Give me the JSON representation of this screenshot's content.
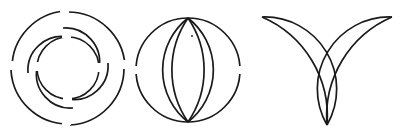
{
  "page": {
    "width": 400,
    "height": 135,
    "background_color": "#ffffff",
    "ink_color": "#1a1a1a",
    "caption_fragment": "",
    "caption_color": "#b9b9b9"
  },
  "figures": [
    {
      "id": "figure-1",
      "name": "pinwheel-arcs",
      "description": "Pinwheel of broken arcs forming concentric rings",
      "center": {
        "x": 68,
        "y": 68
      },
      "stroke_width": 1.6,
      "inner_radius": 31,
      "outer_radius": 57,
      "segment_count": 4
    },
    {
      "id": "figure-2",
      "name": "circle-with-vesica",
      "description": "Circle overlaid with two lens arcs meeting at top and bottom poles",
      "center": {
        "x": 188,
        "y": 70
      },
      "stroke_width": 1.6,
      "radius": 52,
      "pole_top": {
        "x": 188,
        "y": 18
      },
      "pole_bottom": {
        "x": 188,
        "y": 122
      },
      "speck": {
        "x": 192,
        "y": 36,
        "size": 1.6
      }
    },
    {
      "id": "figure-3",
      "name": "chalice-crescents",
      "description": "U / chalice shape built from four crescent arcs converging at one base point",
      "base_point": {
        "x": 327,
        "y": 125
      },
      "stroke_width": 1.6,
      "tip_left": {
        "x": 262,
        "y": 17
      },
      "tip_right": {
        "x": 392,
        "y": 17
      },
      "arc_count": 4
    }
  ],
  "gaps": {
    "description": "All strokes are interrupted by small white breaks",
    "break_color": "#ffffff",
    "break_length": 7
  }
}
